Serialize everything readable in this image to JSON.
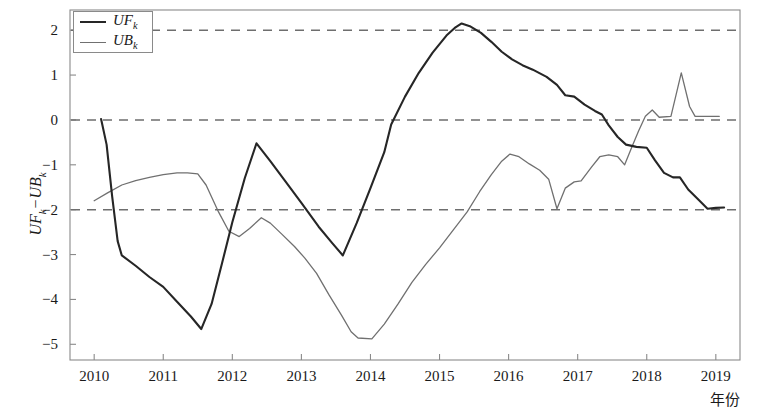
{
  "chart_data": {
    "type": "line",
    "title": "",
    "subtitle": "",
    "xlabel": "年份",
    "ylabel": "UF_k−UB_k",
    "ylabel_parts": {
      "first": "UF",
      "first_sub": "k",
      "minus": "−",
      "second": "UB",
      "second_sub": "k"
    },
    "xlim": [
      2009.65,
      2019.35
    ],
    "ylim": [
      -5.35,
      2.45
    ],
    "grid": false,
    "legend_position": "top-left",
    "x_ticks": [
      2010,
      2011,
      2012,
      2013,
      2014,
      2015,
      2016,
      2017,
      2018,
      2019
    ],
    "x_tick_labels": [
      "2010",
      "2011",
      "2012",
      "2013",
      "2014",
      "2015",
      "2016",
      "2017",
      "2018",
      "2019"
    ],
    "y_ticks": [
      2,
      1,
      0,
      -1,
      -2,
      -3,
      -4,
      -5
    ],
    "y_tick_labels": [
      "2",
      "1",
      "0",
      "−1",
      "−2",
      "−3",
      "−4",
      "−5"
    ],
    "reference_lines": [
      {
        "name": "upper-critical",
        "value": 2.0,
        "style": "dashed",
        "color": "#6e6e6e"
      },
      {
        "name": "zero-line",
        "value": 0.0,
        "style": "dashed",
        "color": "#6e6e6e"
      },
      {
        "name": "lower-critical",
        "value": -2.0,
        "style": "dashed",
        "color": "#6e6e6e"
      }
    ],
    "series": [
      {
        "name": "UF_k",
        "label": "UF",
        "label_sub": "k",
        "color": "#262626",
        "width": 2.1,
        "points": [
          [
            2010.1,
            0.02
          ],
          [
            2010.18,
            -0.55
          ],
          [
            2010.26,
            -1.7
          ],
          [
            2010.34,
            -2.7
          ],
          [
            2010.4,
            -3.02
          ],
          [
            2010.6,
            -3.25
          ],
          [
            2010.8,
            -3.5
          ],
          [
            2011.0,
            -3.72
          ],
          [
            2011.2,
            -4.05
          ],
          [
            2011.4,
            -4.38
          ],
          [
            2011.55,
            -4.66
          ],
          [
            2011.7,
            -4.1
          ],
          [
            2011.85,
            -3.2
          ],
          [
            2012.0,
            -2.28
          ],
          [
            2012.18,
            -1.3
          ],
          [
            2012.35,
            -0.52
          ],
          [
            2012.55,
            -0.92
          ],
          [
            2012.75,
            -1.33
          ],
          [
            2013.0,
            -1.85
          ],
          [
            2013.25,
            -2.38
          ],
          [
            2013.45,
            -2.75
          ],
          [
            2013.6,
            -3.02
          ],
          [
            2013.8,
            -2.3
          ],
          [
            2014.0,
            -1.52
          ],
          [
            2014.2,
            -0.72
          ],
          [
            2014.3,
            -0.1
          ],
          [
            2014.5,
            0.52
          ],
          [
            2014.7,
            1.05
          ],
          [
            2014.9,
            1.5
          ],
          [
            2015.1,
            1.88
          ],
          [
            2015.22,
            2.05
          ],
          [
            2015.32,
            2.15
          ],
          [
            2015.45,
            2.08
          ],
          [
            2015.6,
            1.94
          ],
          [
            2015.75,
            1.74
          ],
          [
            2015.9,
            1.52
          ],
          [
            2016.05,
            1.35
          ],
          [
            2016.2,
            1.22
          ],
          [
            2016.35,
            1.12
          ],
          [
            2016.55,
            0.96
          ],
          [
            2016.7,
            0.78
          ],
          [
            2016.82,
            0.55
          ],
          [
            2016.95,
            0.52
          ],
          [
            2017.1,
            0.34
          ],
          [
            2017.25,
            0.2
          ],
          [
            2017.35,
            0.12
          ],
          [
            2017.45,
            -0.12
          ],
          [
            2017.58,
            -0.38
          ],
          [
            2017.7,
            -0.55
          ],
          [
            2017.85,
            -0.6
          ],
          [
            2018.0,
            -0.62
          ],
          [
            2018.12,
            -0.9
          ],
          [
            2018.25,
            -1.18
          ],
          [
            2018.38,
            -1.28
          ],
          [
            2018.48,
            -1.28
          ],
          [
            2018.6,
            -1.55
          ],
          [
            2018.75,
            -1.78
          ],
          [
            2018.88,
            -1.98
          ],
          [
            2019.0,
            -1.96
          ],
          [
            2019.12,
            -1.95
          ]
        ]
      },
      {
        "name": "UB_k",
        "label": "UB",
        "label_sub": "k",
        "color": "#707070",
        "width": 1.3,
        "points": [
          [
            2010.0,
            -1.8
          ],
          [
            2010.2,
            -1.62
          ],
          [
            2010.4,
            -1.45
          ],
          [
            2010.6,
            -1.35
          ],
          [
            2010.8,
            -1.28
          ],
          [
            2011.0,
            -1.22
          ],
          [
            2011.2,
            -1.18
          ],
          [
            2011.35,
            -1.18
          ],
          [
            2011.5,
            -1.2
          ],
          [
            2011.62,
            -1.45
          ],
          [
            2011.8,
            -2.05
          ],
          [
            2011.95,
            -2.48
          ],
          [
            2012.1,
            -2.6
          ],
          [
            2012.25,
            -2.42
          ],
          [
            2012.42,
            -2.18
          ],
          [
            2012.55,
            -2.3
          ],
          [
            2012.72,
            -2.55
          ],
          [
            2012.9,
            -2.82
          ],
          [
            2013.05,
            -3.08
          ],
          [
            2013.22,
            -3.42
          ],
          [
            2013.4,
            -3.9
          ],
          [
            2013.58,
            -4.35
          ],
          [
            2013.72,
            -4.72
          ],
          [
            2013.82,
            -4.86
          ],
          [
            2014.02,
            -4.88
          ],
          [
            2014.2,
            -4.55
          ],
          [
            2014.4,
            -4.1
          ],
          [
            2014.6,
            -3.62
          ],
          [
            2014.8,
            -3.22
          ],
          [
            2015.0,
            -2.85
          ],
          [
            2015.2,
            -2.45
          ],
          [
            2015.4,
            -2.05
          ],
          [
            2015.58,
            -1.6
          ],
          [
            2015.75,
            -1.22
          ],
          [
            2015.9,
            -0.92
          ],
          [
            2016.02,
            -0.76
          ],
          [
            2016.15,
            -0.82
          ],
          [
            2016.3,
            -0.98
          ],
          [
            2016.45,
            -1.12
          ],
          [
            2016.58,
            -1.32
          ],
          [
            2016.7,
            -1.98
          ],
          [
            2016.82,
            -1.52
          ],
          [
            2016.95,
            -1.38
          ],
          [
            2017.05,
            -1.36
          ],
          [
            2017.2,
            -1.05
          ],
          [
            2017.32,
            -0.82
          ],
          [
            2017.45,
            -0.78
          ],
          [
            2017.58,
            -0.82
          ],
          [
            2017.68,
            -1.0
          ],
          [
            2017.78,
            -0.62
          ],
          [
            2017.88,
            -0.25
          ],
          [
            2017.98,
            0.08
          ],
          [
            2018.08,
            0.22
          ],
          [
            2018.18,
            0.06
          ],
          [
            2018.35,
            0.08
          ],
          [
            2018.5,
            1.05
          ],
          [
            2018.62,
            0.3
          ],
          [
            2018.7,
            0.08
          ],
          [
            2018.85,
            0.08
          ],
          [
            2019.05,
            0.08
          ]
        ]
      }
    ]
  },
  "axis_style": {
    "frame_color": "#8a8a8a",
    "tick_color": "#8a8a8a",
    "background": "#ffffff"
  },
  "legend": {
    "entries": [
      {
        "label": "UF",
        "sub": "k",
        "color": "#262626"
      },
      {
        "label": "UB",
        "sub": "k",
        "color": "#707070"
      }
    ]
  }
}
